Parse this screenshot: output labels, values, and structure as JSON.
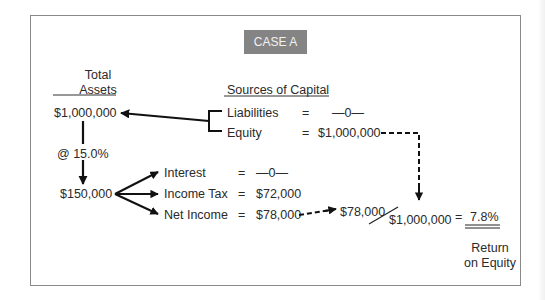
{
  "title": "CASE A",
  "total_assets": {
    "header_line1": "Total",
    "header_line2": "Assets",
    "value": "$1,000,000",
    "rate": "@ 15.0%",
    "earnings": "$150,000"
  },
  "sources_of_capital": {
    "header": "Sources of Capital",
    "items": [
      {
        "label": "Liabilities",
        "eq": "=",
        "value": "—0—"
      },
      {
        "label": "Equity",
        "eq": "=",
        "value": "$1,000,000"
      }
    ]
  },
  "allocation": [
    {
      "label": "Interest",
      "eq": "=",
      "value": "—0—"
    },
    {
      "label": "Income Tax",
      "eq": "=",
      "value": "$72,000"
    },
    {
      "label": "Net Income",
      "eq": "=",
      "value": "$78,000"
    }
  ],
  "ratio": {
    "numerator": "$78,000",
    "denominator": "$1,000,000",
    "eq": "=",
    "result": "7.8%",
    "caption_line1": "Return",
    "caption_line2": "on Equity"
  },
  "colors": {
    "label_bg": "#848484",
    "line": "#111111",
    "frame": "#8a8a8a"
  }
}
